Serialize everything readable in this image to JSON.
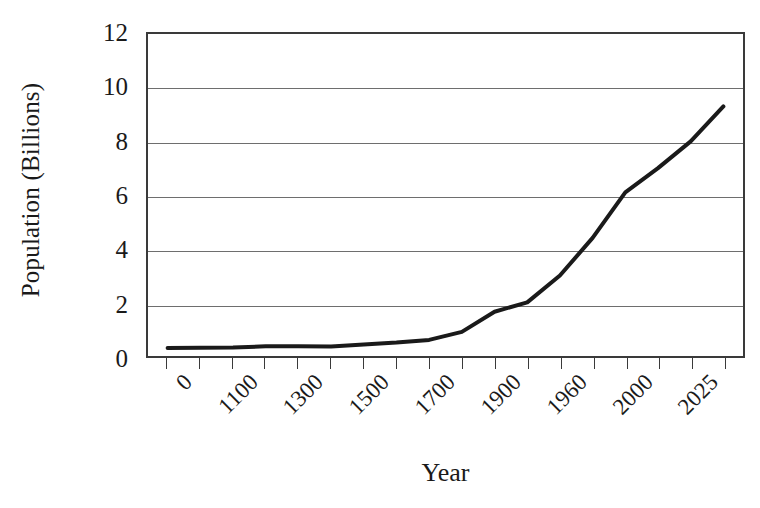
{
  "chart_data": {
    "type": "line",
    "title": "",
    "subtitle": "",
    "xlabel": "Year",
    "ylabel": "Population (Billions)",
    "ylim": [
      0,
      12
    ],
    "ytick_values": [
      0,
      2,
      4,
      6,
      8,
      10,
      12
    ],
    "ytick_labels": [
      "0",
      "2",
      "4",
      "6",
      "8",
      "10",
      "12"
    ],
    "xtick_labels": [
      "0",
      "1100",
      "1300",
      "1500",
      "1700",
      "1900",
      "1960",
      "2000",
      "2025"
    ],
    "xtick_count": 18,
    "xtick_label_interval": 2,
    "grid": true,
    "grid_axis": "y",
    "legend": false,
    "legend_position": "none",
    "line_color": "#1a1a1a",
    "grid_color": "#6e6e6e",
    "axis_color": "#3a3a3a",
    "background_color": "#ffffff",
    "categories": [
      "0",
      "1000",
      "1100",
      "1200",
      "1300",
      "1400",
      "1500",
      "1600",
      "1700",
      "1800",
      "1900",
      "1930",
      "1960",
      "1980",
      "2000",
      "2012",
      "2025",
      "2050"
    ],
    "values": [
      0.3,
      0.31,
      0.32,
      0.36,
      0.36,
      0.35,
      0.43,
      0.5,
      0.6,
      0.9,
      1.65,
      2.0,
      3.0,
      4.4,
      6.1,
      7.0,
      8.0,
      9.3
    ],
    "series": [
      {
        "name": "World population",
        "values": [
          0.3,
          0.31,
          0.32,
          0.36,
          0.36,
          0.35,
          0.43,
          0.5,
          0.6,
          0.9,
          1.65,
          2.0,
          3.0,
          4.4,
          6.1,
          7.0,
          8.0,
          9.3
        ]
      }
    ],
    "annotations": []
  }
}
